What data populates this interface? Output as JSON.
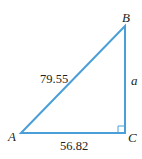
{
  "diagram": {
    "type": "right-triangle",
    "stroke_color": "#4a9fd8",
    "vertices": {
      "A": {
        "label": "A",
        "x": 21,
        "y": 133
      },
      "B": {
        "label": "B",
        "x": 125,
        "y": 26
      },
      "C": {
        "label": "C",
        "x": 125,
        "y": 133
      }
    },
    "right_angle_at": "C",
    "sides": {
      "hypotenuse_AB": "79.55",
      "base_AC": "56.82",
      "leg_BC": "a"
    }
  }
}
